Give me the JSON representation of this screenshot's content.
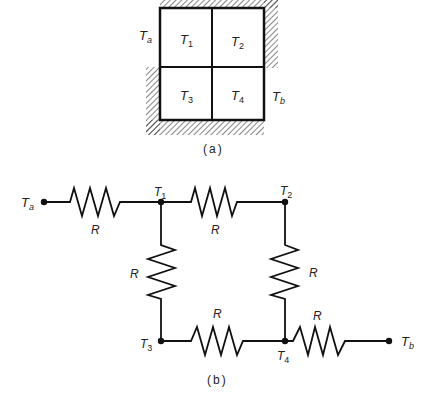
{
  "figure_a": {
    "caption": "(a)",
    "cells": [
      {
        "label": "T",
        "sub": "1"
      },
      {
        "label": "T",
        "sub": "2"
      },
      {
        "label": "T",
        "sub": "3"
      },
      {
        "label": "T",
        "sub": "4"
      }
    ],
    "boundary_labels": [
      {
        "label": "T",
        "sub": "a"
      },
      {
        "label": "T",
        "sub": "b"
      }
    ]
  },
  "figure_b": {
    "caption": "(b)",
    "nodes": [
      {
        "label": "T",
        "sub": "a"
      },
      {
        "label": "T",
        "sub": "1"
      },
      {
        "label": "T",
        "sub": "2"
      },
      {
        "label": "T",
        "sub": "3"
      },
      {
        "label": "T",
        "sub": "4"
      },
      {
        "label": "T",
        "sub": "b"
      }
    ],
    "resistors": [
      {
        "label": "R",
        "from": "Ta",
        "to": "T1"
      },
      {
        "label": "R",
        "from": "T1",
        "to": "T2"
      },
      {
        "label": "R",
        "from": "T1",
        "to": "T3"
      },
      {
        "label": "R",
        "from": "T2",
        "to": "T4"
      },
      {
        "label": "R",
        "from": "T3",
        "to": "T4"
      },
      {
        "label": "R",
        "from": "T4",
        "to": "Tb"
      }
    ]
  },
  "colors": {
    "line": "#111111",
    "text": "#222222",
    "background": "#ffffff"
  }
}
